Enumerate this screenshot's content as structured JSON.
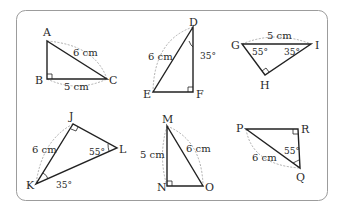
{
  "panel": {
    "border_color": "#9c9c9c",
    "line_color": "#222222",
    "dash_color": "#9a9a9a"
  },
  "triangles": [
    {
      "id": "ABC",
      "vertices": {
        "A": "A",
        "B": "B",
        "C": "C"
      },
      "right_angle": "B",
      "side_AC": "6 cm",
      "side_BC": "5 cm"
    },
    {
      "id": "DEF",
      "vertices": {
        "D": "D",
        "E": "E",
        "F": "F"
      },
      "right_angle": "F",
      "side_DE": "6 cm",
      "angle_D": "35°"
    },
    {
      "id": "GHI",
      "vertices": {
        "G": "G",
        "H": "H",
        "I": "I"
      },
      "right_angle": "H",
      "side_GI": "5 cm",
      "angle_G": "55°",
      "angle_I": "35°"
    },
    {
      "id": "JKL",
      "vertices": {
        "J": "J",
        "K": "K",
        "L": "L"
      },
      "right_angle": "J",
      "side_JK": "6 cm",
      "angle_L": "55°",
      "angle_K": "35°"
    },
    {
      "id": "MNO",
      "vertices": {
        "M": "M",
        "N": "N",
        "O": "O"
      },
      "right_angle": "N",
      "side_MN": "5 cm",
      "side_MO": "6 cm"
    },
    {
      "id": "PQR",
      "vertices": {
        "P": "P",
        "Q": "Q",
        "R": "R"
      },
      "right_angle": "R",
      "side_PQ": "6 cm",
      "angle_Q": "55°"
    }
  ]
}
